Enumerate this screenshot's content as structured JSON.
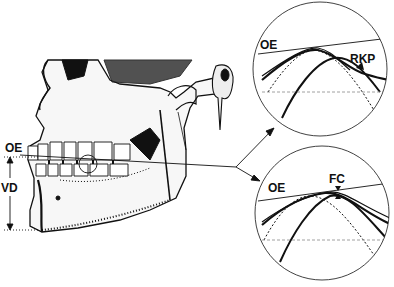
{
  "figure": {
    "skull": {
      "labels": {
        "occlusal_plane": "OE",
        "vertical_dimension": "VD"
      }
    },
    "detail_top": {
      "labels": {
        "occlusal_plane": "OE",
        "contact_point": "RKP"
      }
    },
    "detail_bottom": {
      "labels": {
        "occlusal_plane": "OE",
        "contact_point": "FC"
      }
    }
  },
  "colors": {
    "ink": "#111111",
    "background": "#ffffff",
    "dashed_guide": "#888888"
  }
}
